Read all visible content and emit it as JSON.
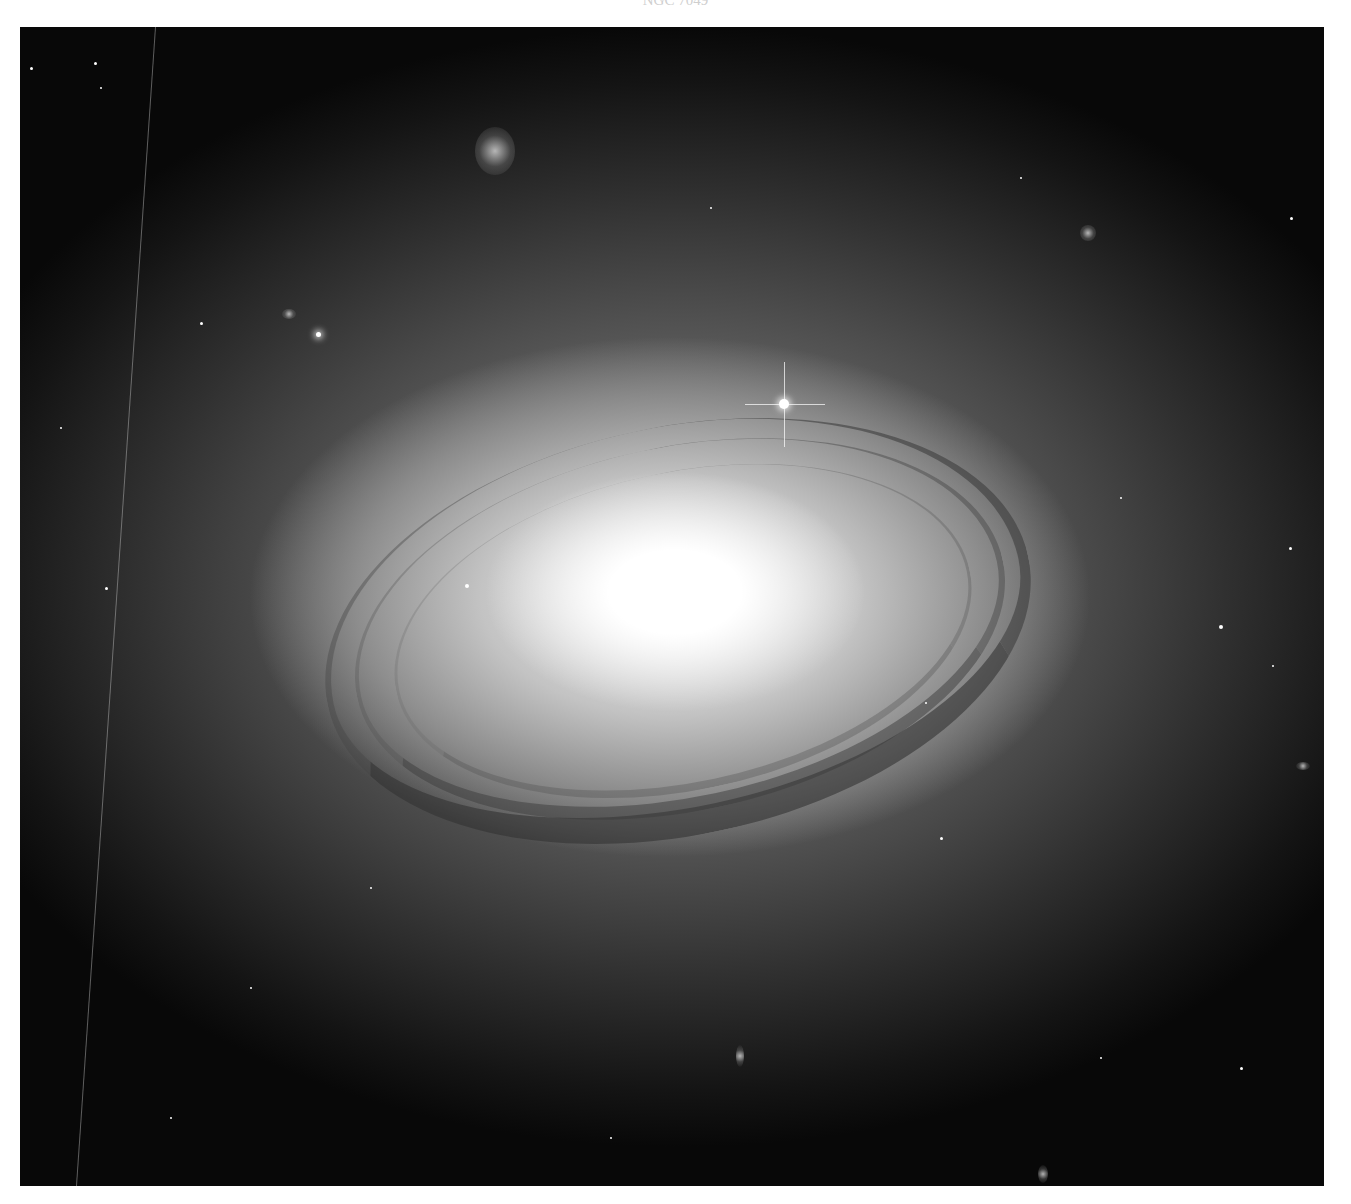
{
  "caption": {
    "text": "NGC 7049"
  },
  "image": {
    "subject": "lenticular galaxy with dust lane ring",
    "description": "Grayscale astronomical photograph of a bright elliptical/lenticular galaxy with a prominent dark dust ring, a diffraction-spiked foreground star above the core, scattered background stars and small galaxies on a black sky.",
    "colors": {
      "sky": "#080808",
      "halo": "#8a8a8a",
      "core": "#ffffff",
      "dust": "#3c3c3c"
    }
  }
}
